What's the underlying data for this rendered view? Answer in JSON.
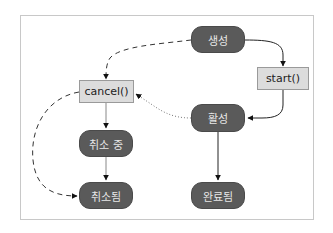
{
  "diagram": {
    "type": "state-transition",
    "nodes": {
      "created": {
        "label": "생성",
        "kind": "state"
      },
      "start": {
        "label": "start()",
        "kind": "method"
      },
      "active": {
        "label": "활성",
        "kind": "state"
      },
      "completed": {
        "label": "완료됨",
        "kind": "state"
      },
      "cancel": {
        "label": "cancel()",
        "kind": "method"
      },
      "cancelling": {
        "label": "취소 중",
        "kind": "state"
      },
      "cancelled": {
        "label": "취소됨",
        "kind": "state"
      }
    },
    "edges": [
      {
        "from": "생성",
        "to": "start()",
        "style": "solid"
      },
      {
        "from": "start()",
        "to": "활성",
        "style": "solid"
      },
      {
        "from": "활성",
        "to": "완료됨",
        "style": "solid"
      },
      {
        "from": "생성",
        "to": "cancel()",
        "style": "dashed"
      },
      {
        "from": "활성",
        "to": "cancel()",
        "style": "dotted"
      },
      {
        "from": "cancel()",
        "to": "취소 중",
        "style": "solid-light"
      },
      {
        "from": "취소 중",
        "to": "취소됨",
        "style": "solid-light"
      },
      {
        "from": "cancel()",
        "to": "취소됨",
        "style": "dashed"
      }
    ],
    "colors": {
      "state_fill": "#5a5a5a",
      "state_text": "#e8e8e8",
      "method_fill": "#dcdcdc",
      "method_border": "#9a9a9a",
      "edge": "#222222",
      "frame_border": "#c8c8c8"
    }
  }
}
